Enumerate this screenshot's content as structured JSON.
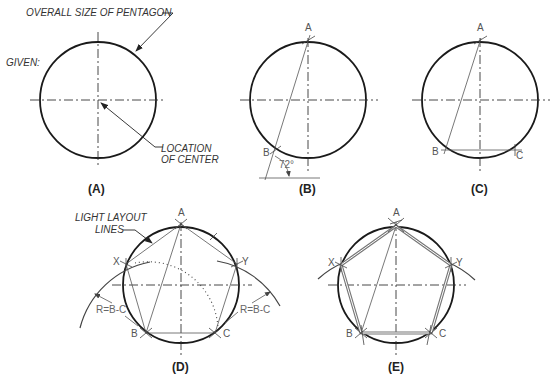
{
  "figure": {
    "panels": [
      {
        "id": "A",
        "caption": "(A)",
        "labels": {
          "given": "GIVEN:",
          "overall_size": "OVERALL SIZE OF PENTAGON",
          "location_line1": "LOCATION",
          "location_line2": "OF CENTER"
        }
      },
      {
        "id": "B",
        "caption": "(B)",
        "points": {
          "a": "A",
          "b": "B"
        },
        "angle": "72°"
      },
      {
        "id": "C",
        "caption": "(C)",
        "points": {
          "a": "A",
          "b": "B",
          "c": "C"
        }
      },
      {
        "id": "D",
        "caption": "(D)",
        "labels": {
          "layout_line1": "LIGHT LAYOUT",
          "layout_line2": "LINES",
          "radius_left": "R=B-C",
          "radius_right": "R=B-C"
        },
        "points": {
          "a": "A",
          "b": "B",
          "c": "C",
          "x": "X",
          "y": "Y"
        }
      },
      {
        "id": "E",
        "caption": "(E)",
        "points": {
          "a": "A",
          "b": "B",
          "c": "C",
          "x": "X",
          "y": "Y"
        }
      }
    ]
  }
}
